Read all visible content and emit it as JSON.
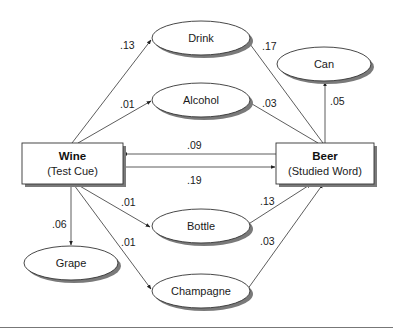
{
  "diagram": {
    "type": "associative-network",
    "nodes": {
      "wine": {
        "title": "Wine",
        "subtitle": "(Test Cue)",
        "shape": "box"
      },
      "beer": {
        "title": "Beer",
        "subtitle": "(Studied Word)",
        "shape": "box"
      },
      "drink": {
        "label": "Drink",
        "shape": "ellipse"
      },
      "alcohol": {
        "label": "Alcohol",
        "shape": "ellipse"
      },
      "can": {
        "label": "Can",
        "shape": "ellipse"
      },
      "grape": {
        "label": "Grape",
        "shape": "ellipse"
      },
      "bottle": {
        "label": "Bottle",
        "shape": "ellipse"
      },
      "champagne": {
        "label": "Champagne",
        "shape": "ellipse"
      }
    },
    "edges": {
      "wine_drink": {
        "from": "Wine",
        "to": "Drink",
        "weight": ".13"
      },
      "wine_alcohol": {
        "from": "Wine",
        "to": "Alcohol",
        "weight": ".01"
      },
      "beer_drink": {
        "from": "Beer",
        "to": "Drink",
        "weight": ".17"
      },
      "beer_alcohol": {
        "from": "Beer",
        "to": "Alcohol",
        "weight": ".03"
      },
      "beer_can": {
        "from": "Beer",
        "to": "Can",
        "weight": ".05"
      },
      "beer_wine": {
        "from": "Beer",
        "to": "Wine",
        "weight": ".09"
      },
      "wine_beer": {
        "from": "Wine",
        "to": "Beer",
        "weight": ".19"
      },
      "wine_grape": {
        "from": "Wine",
        "to": "Grape",
        "weight": ".06"
      },
      "wine_bottle": {
        "from": "Wine",
        "to": "Bottle",
        "weight": ".01"
      },
      "wine_champagne": {
        "from": "Wine",
        "to": "Champagne",
        "weight": ".01"
      },
      "bottle_beer": {
        "from": "Bottle",
        "to": "Beer",
        "weight": ".13"
      },
      "champagne_beer": {
        "from": "Champagne",
        "to": "Beer",
        "weight": ".03"
      }
    },
    "colors": {
      "stroke": "#333333",
      "shadow": "#7a7a7a",
      "fill": "#ffffff",
      "rule": "#777777"
    }
  }
}
